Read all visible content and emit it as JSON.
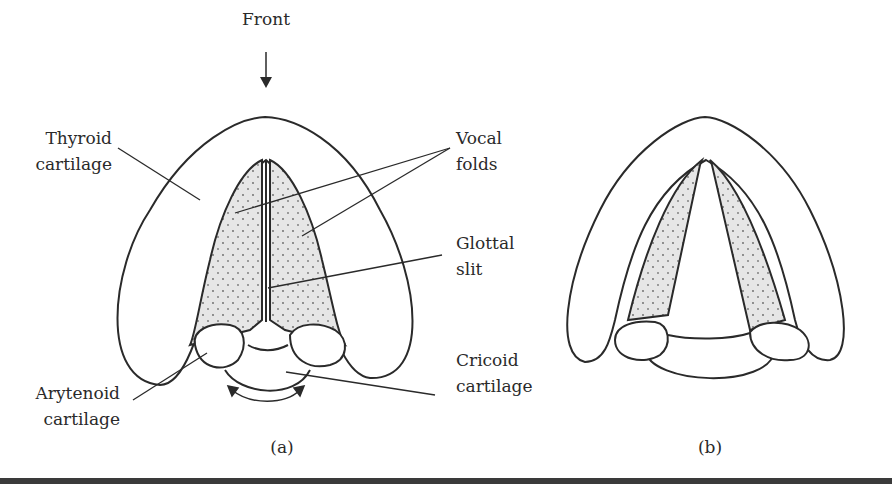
{
  "figure": {
    "panels": [
      {
        "id": "a",
        "caption": "(a)",
        "state": "closed glottis"
      },
      {
        "id": "b",
        "caption": "(b)",
        "state": "open glottis"
      }
    ],
    "labels": {
      "front": "Front",
      "thyroid": [
        "Thyroid",
        "cartilage"
      ],
      "vocal_folds": [
        "Vocal",
        "folds"
      ],
      "glottal_slit": [
        "Glottal",
        "slit"
      ],
      "cricoid": [
        "Cricoid",
        "cartilage"
      ],
      "arytenoid": [
        "Arytenoid",
        "cartilage"
      ]
    },
    "colors": {
      "stroke": "#2a2a2a",
      "fold_fill": "#e6e6e6",
      "rule": "#3a3a3a"
    }
  }
}
